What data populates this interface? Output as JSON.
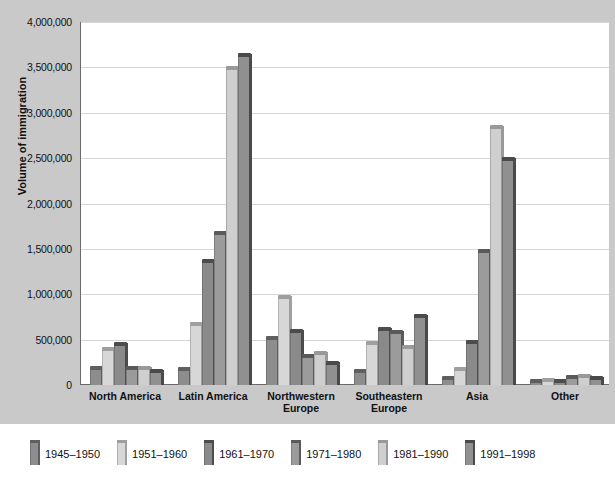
{
  "chart_data": {
    "type": "bar",
    "title": "",
    "subtitle": "",
    "xlabel": "",
    "ylabel": "Volume of immigration",
    "ylim": [
      0,
      4000000
    ],
    "ytick_labels": [
      "4,000,000",
      "3,500,000",
      "3,000,000",
      "2,500,000",
      "2,000,000",
      "1,500,000",
      "1,000,000",
      "500,000",
      "0"
    ],
    "ytick_values": [
      4000000,
      3500000,
      3000000,
      2500000,
      2000000,
      1500000,
      1000000,
      500000,
      0
    ],
    "grid": true,
    "legend_position": "bottom",
    "categories": [
      "North America",
      "Latin America",
      "Northwestern Europe",
      "Southeastern Europe",
      "Asia",
      "Other"
    ],
    "category_lines": [
      [
        "North America"
      ],
      [
        "Latin America"
      ],
      [
        "Northwestern",
        "Europe"
      ],
      [
        "Southeastern",
        "Europe"
      ],
      [
        "Asia"
      ],
      [
        "Other"
      ]
    ],
    "series": [
      {
        "name": "1945–1950",
        "color": "#8d8d8d",
        "cap": "#5f5f5f",
        "values": [
          160000,
          150000,
          500000,
          130000,
          60000,
          20000
        ]
      },
      {
        "name": "1951–1960",
        "color": "#d7d7d7",
        "cap": "#9f9f9f",
        "values": [
          380000,
          650000,
          950000,
          440000,
          150000,
          30000
        ]
      },
      {
        "name": "1961–1970",
        "color": "#8a8a8a",
        "cap": "#4c4c4c",
        "values": [
          430000,
          1350000,
          570000,
          600000,
          450000,
          20000
        ]
      },
      {
        "name": "1971–1980",
        "color": "#9b9b9b",
        "cap": "#5a5a5a",
        "values": [
          170000,
          1650000,
          300000,
          560000,
          1450000,
          70000
        ]
      },
      {
        "name": "1981–1990",
        "color": "#cfcfcf",
        "cap": "#999999",
        "values": [
          160000,
          3470000,
          330000,
          400000,
          2820000,
          80000
        ]
      },
      {
        "name": "1991–1998",
        "color": "#909090",
        "cap": "#4a4a4a",
        "values": [
          130000,
          3620000,
          220000,
          740000,
          2470000,
          50000
        ]
      }
    ]
  }
}
